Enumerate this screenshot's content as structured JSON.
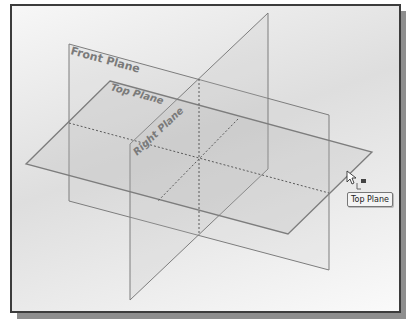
{
  "viewport": {
    "type": "3d-graphics-area",
    "planes": [
      {
        "name": "Front Plane",
        "label": "Front Plane"
      },
      {
        "name": "Top Plane",
        "label": "Top Plane"
      },
      {
        "name": "Right Plane",
        "label": "Right Plane"
      }
    ]
  },
  "labels": {
    "front_plane": "Front Plane",
    "top_plane": "Top Plane",
    "right_plane": "Right Plane"
  },
  "tooltip": {
    "text": "Top Plane"
  },
  "cursor": {
    "icon": "arrow-with-plane-select-icon"
  },
  "colors": {
    "plane_edge": "#7d7d7d",
    "dashed_intersection": "#5a5a5a",
    "frame_border": "#3c3c3c",
    "frame_shadow": "#8e8e8e",
    "label_text": "#7a7a7a"
  }
}
